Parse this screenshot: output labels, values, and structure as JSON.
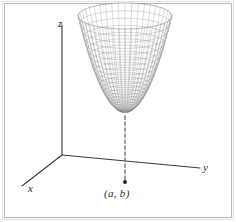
{
  "figure": {
    "title": "",
    "axis_labels": {
      "x": "x",
      "y": "y",
      "z": "z"
    },
    "point_label": "(a, b)",
    "colors": {
      "mesh": "#7a7a7a",
      "axis": "#3a3a3a",
      "dashed": "#6b6b6b",
      "point": "#1a1a1a",
      "frame": "#b9b9b9",
      "background": "#ffffff"
    }
  },
  "chart_data": {
    "type": "line",
    "title": "",
    "xlabel": "x",
    "ylabel": "y",
    "zlabel": "z",
    "surface_function": "z = (u^2) scaled paraboloid with elliptical cross-sections",
    "mesh": {
      "u_steps": 26,
      "v_steps": 22,
      "radius_max": 1.0,
      "height_scale": 1.0
    },
    "projection": {
      "origin_px": [
        62,
        155
      ],
      "x_axis_end_px": [
        22,
        186
      ],
      "y_axis_end_px": [
        200,
        168
      ],
      "z_axis_end_px": [
        62,
        25
      ],
      "surface_center_px": [
        125,
        112
      ],
      "ellipse_rx_px": 47,
      "ellipse_ry_px": 13
    },
    "annotations": [
      {
        "text": "z",
        "x_px": 58,
        "y_px": 18
      },
      {
        "text": "x",
        "x_px": 28,
        "y_px": 183
      },
      {
        "text": "y",
        "x_px": 203,
        "y_px": 162
      },
      {
        "text": "(a, b)",
        "x_px": 104,
        "y_px": 187
      }
    ],
    "marked_point": {
      "label": "(a, b)",
      "px": [
        125,
        182
      ]
    },
    "dashed_line": {
      "from_px": [
        125,
        116
      ],
      "to_px": [
        125,
        182
      ]
    },
    "grid": false,
    "legend": null
  }
}
